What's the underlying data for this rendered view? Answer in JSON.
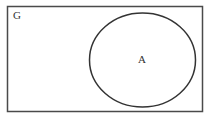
{
  "diagram": {
    "type": "venn",
    "universe_label": "G",
    "sets": [
      {
        "label": "A"
      }
    ],
    "colors": {
      "stroke": "#333333",
      "background": "#ffffff"
    }
  }
}
